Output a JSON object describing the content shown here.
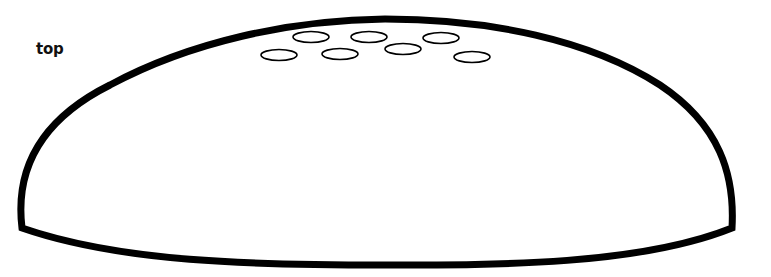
{
  "diagram": {
    "label": "top",
    "colors": {
      "stroke": "#000000",
      "fill": "#ffffff",
      "label": "#111111"
    },
    "dome": {
      "outline_width": 7,
      "description": "dome / half-ellipse shape with curved base"
    },
    "holes": [
      {
        "cx": 311,
        "cy": 37,
        "rx": 18,
        "ry": 5.5
      },
      {
        "cx": 369,
        "cy": 37,
        "rx": 18,
        "ry": 5.5
      },
      {
        "cx": 441,
        "cy": 38,
        "rx": 18,
        "ry": 5.5
      },
      {
        "cx": 279,
        "cy": 55,
        "rx": 18,
        "ry": 5.5
      },
      {
        "cx": 340,
        "cy": 54,
        "rx": 18,
        "ry": 5.5
      },
      {
        "cx": 403,
        "cy": 49,
        "rx": 18,
        "ry": 5.5
      },
      {
        "cx": 472,
        "cy": 57,
        "rx": 18,
        "ry": 5.5
      }
    ]
  }
}
